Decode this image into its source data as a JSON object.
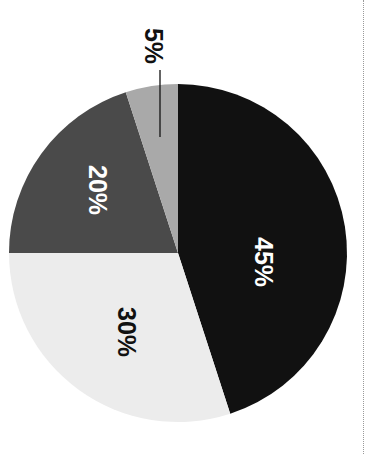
{
  "chart_data": {
    "type": "pie",
    "title": "",
    "orientation_note": "rotated 90 degrees clockwise",
    "categories": [
      "Slice A",
      "Slice B",
      "Slice C",
      "Slice D"
    ],
    "values": [
      45,
      30,
      20,
      5
    ],
    "labels": [
      "45%",
      "30%",
      "20%",
      "5%"
    ],
    "colors": [
      "#111111",
      "#ececec",
      "#4a4a4a",
      "#a9a9a9"
    ],
    "label_colors": [
      "#ffffff",
      "#111111",
      "#ffffff",
      "#111111"
    ],
    "legend": null
  }
}
